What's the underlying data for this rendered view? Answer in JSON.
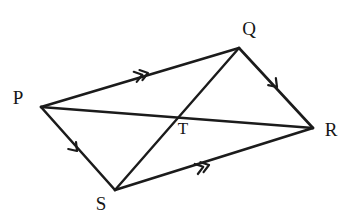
{
  "figure": {
    "type": "geometry-diagram",
    "shape": "quadrilateral-with-diagonals",
    "name": "PQRS",
    "background_color": "#ffffff",
    "ink_color": "#1b1b1b",
    "width": 350,
    "height": 223
  },
  "labels": {
    "p": "P",
    "q": "Q",
    "r": "R",
    "s": "S",
    "t": "T"
  },
  "vertices": [
    {
      "id": "P",
      "label": "P",
      "x": 41,
      "y": 107,
      "label_x": 18,
      "label_y": 100
    },
    {
      "id": "Q",
      "label": "Q",
      "x": 239,
      "y": 48,
      "label_x": 249,
      "label_y": 31
    },
    {
      "id": "R",
      "label": "R",
      "x": 313,
      "y": 128,
      "label_x": 331,
      "label_y": 132
    },
    {
      "id": "S",
      "label": "S",
      "x": 115,
      "y": 190,
      "label_x": 101,
      "label_y": 206
    },
    {
      "id": "T",
      "label": "T",
      "x": 176,
      "y": 117,
      "label_x": 183,
      "label_y": 130
    }
  ],
  "segments": [
    {
      "id": "PQ",
      "from": "P",
      "to": "Q",
      "kind": "side",
      "ticks": 2,
      "tick_x": 148,
      "tick_y": 73
    },
    {
      "id": "QR",
      "from": "Q",
      "to": "R",
      "kind": "side",
      "ticks": 1,
      "tick_x": 277,
      "tick_y": 87
    },
    {
      "id": "SR",
      "from": "S",
      "to": "R",
      "kind": "side",
      "ticks": 2,
      "tick_x": 209,
      "tick_y": 165
    },
    {
      "id": "PS",
      "from": "P",
      "to": "S",
      "kind": "side",
      "ticks": 1,
      "tick_x": 77,
      "tick_y": 151
    },
    {
      "id": "PR",
      "from": "P",
      "to": "R",
      "kind": "diagonal",
      "ticks": 0
    },
    {
      "id": "QS",
      "from": "Q",
      "to": "S",
      "kind": "diagonal",
      "ticks": 0
    }
  ],
  "intersection": {
    "id": "T",
    "label": "T",
    "of": [
      "PR",
      "QS"
    ],
    "x": 176,
    "y": 117
  }
}
